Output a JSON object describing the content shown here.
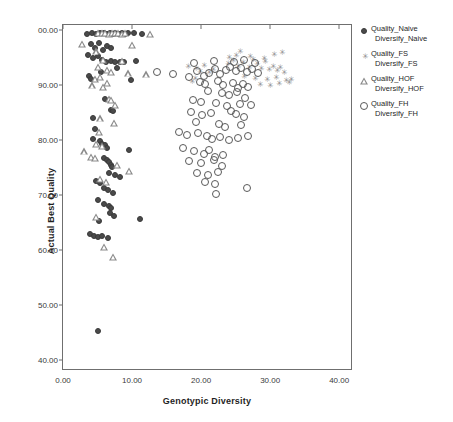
{
  "chart_data": {
    "type": "scatter",
    "title": "",
    "xlabel": "Genotypic Diversity",
    "ylabel": "Actual Best Quality",
    "xlim": [
      0,
      42
    ],
    "ylim": [
      38,
      101
    ],
    "xticks": [
      "0.00",
      "10.00",
      "20.00",
      "30.00",
      "40.00"
    ],
    "xtick_values": [
      0,
      10,
      20,
      30,
      40
    ],
    "yticks": [
      "00.00",
      "90.00",
      "80.00",
      "70.00",
      "60.00",
      "50.00",
      "40.00"
    ],
    "ytick_values": [
      100,
      90,
      80,
      70,
      60,
      50,
      40
    ],
    "grid": false,
    "legend_position": "right",
    "series": [
      {
        "name": "Quality_Naive",
        "name_line2": "Diversify_Naive",
        "marker": "filled-circle",
        "color": "#4a4a4a",
        "points": [
          [
            3.5,
            99.4
          ],
          [
            4.2,
            99.6
          ],
          [
            4.8,
            99.3
          ],
          [
            5.4,
            99.5
          ],
          [
            5.9,
            99.6
          ],
          [
            6.3,
            99.4
          ],
          [
            6.8,
            99.6
          ],
          [
            7.2,
            99.3
          ],
          [
            7.6,
            99.5
          ],
          [
            8.1,
            99.4
          ],
          [
            8.6,
            99.6
          ],
          [
            9.0,
            99.3
          ],
          [
            9.4,
            99.5
          ],
          [
            10.3,
            99.5
          ],
          [
            11.4,
            99.4
          ],
          [
            4.0,
            97.6
          ],
          [
            4.6,
            96.9
          ],
          [
            5.2,
            97.8
          ],
          [
            5.8,
            96.4
          ],
          [
            6.4,
            97.2
          ],
          [
            7.0,
            96.8
          ],
          [
            3.6,
            95.6
          ],
          [
            4.4,
            95.0
          ],
          [
            5.0,
            95.4
          ],
          [
            5.6,
            94.6
          ],
          [
            6.2,
            94.2
          ],
          [
            6.9,
            94.4
          ],
          [
            7.5,
            94.3
          ],
          [
            8.2,
            94.3
          ],
          [
            8.8,
            94.2
          ],
          [
            10.6,
            94.5
          ],
          [
            7.8,
            93.2
          ],
          [
            5.5,
            92.4
          ],
          [
            3.8,
            91.8
          ],
          [
            4.1,
            91.2
          ],
          [
            9.8,
            91.0
          ],
          [
            6.1,
            87.6
          ],
          [
            7.0,
            85.6
          ],
          [
            7.3,
            85.4
          ],
          [
            4.3,
            84.1
          ],
          [
            4.6,
            82.0
          ],
          [
            4.4,
            80.2
          ],
          [
            5.3,
            79.8
          ],
          [
            5.7,
            79.4
          ],
          [
            6.1,
            79.1
          ],
          [
            6.4,
            78.6
          ],
          [
            9.6,
            78.3
          ],
          [
            5.9,
            76.8
          ],
          [
            6.3,
            76.4
          ],
          [
            6.7,
            76.0
          ],
          [
            6.9,
            75.6
          ],
          [
            7.1,
            75.2
          ],
          [
            6.6,
            74.0
          ],
          [
            7.5,
            73.6
          ],
          [
            8.2,
            73.4
          ],
          [
            4.8,
            72.6
          ],
          [
            5.4,
            72.2
          ],
          [
            6.0,
            71.4
          ],
          [
            6.5,
            70.9
          ],
          [
            7.2,
            70.4
          ],
          [
            5.0,
            69.2
          ],
          [
            5.9,
            68.4
          ],
          [
            6.6,
            68.0
          ],
          [
            7.0,
            67.6
          ],
          [
            6.8,
            66.8
          ],
          [
            7.4,
            66.2
          ],
          [
            5.2,
            65.4
          ],
          [
            3.9,
            63.0
          ],
          [
            4.5,
            62.6
          ],
          [
            5.1,
            62.4
          ],
          [
            5.7,
            62.5
          ],
          [
            6.5,
            62.2
          ],
          [
            11.2,
            65.6
          ],
          [
            5.0,
            45.2
          ]
        ]
      },
      {
        "name": "Quality_FS",
        "name_line2": "Diversify_FS",
        "marker": "asterisk",
        "color": "#8c8c8c",
        "points": [
          [
            18.0,
            93.6
          ],
          [
            19.2,
            93.2
          ],
          [
            19.8,
            92.6
          ],
          [
            20.4,
            93.8
          ],
          [
            21.0,
            92.4
          ],
          [
            21.6,
            93.0
          ],
          [
            23.8,
            94.0
          ],
          [
            24.6,
            94.6
          ],
          [
            25.3,
            93.6
          ],
          [
            26.0,
            94.2
          ],
          [
            26.8,
            93.4
          ],
          [
            27.4,
            94.8
          ],
          [
            28.0,
            94.1
          ],
          [
            28.6,
            93.2
          ],
          [
            29.2,
            94.4
          ],
          [
            29.8,
            93.0
          ],
          [
            30.3,
            93.6
          ],
          [
            30.9,
            92.8
          ],
          [
            31.4,
            93.4
          ],
          [
            31.9,
            92.4
          ],
          [
            24.0,
            95.2
          ],
          [
            25.0,
            95.6
          ],
          [
            27.0,
            95.4
          ],
          [
            29.0,
            95.0
          ],
          [
            30.5,
            95.8
          ],
          [
            26.2,
            91.8
          ],
          [
            27.8,
            91.4
          ],
          [
            29.4,
            91.2
          ],
          [
            30.8,
            91.6
          ],
          [
            32.2,
            91.0
          ],
          [
            28.4,
            90.2
          ],
          [
            29.9,
            90.0
          ],
          [
            31.2,
            90.4
          ],
          [
            32.6,
            90.6
          ],
          [
            33.0,
            91.2
          ],
          [
            25.6,
            96.2
          ],
          [
            31.6,
            96.0
          ],
          [
            19.0,
            91.4
          ],
          [
            18.6,
            90.8
          ]
        ]
      },
      {
        "name": "Quality_HOF",
        "name_line2": "Diversify_HOF",
        "marker": "open-triangle",
        "color": "#8a8a8a",
        "points": [
          [
            5.0,
            99.6
          ],
          [
            5.6,
            99.5
          ],
          [
            6.1,
            99.6
          ],
          [
            6.6,
            99.4
          ],
          [
            7.1,
            99.6
          ],
          [
            7.6,
            99.5
          ],
          [
            8.0,
            99.6
          ],
          [
            8.5,
            99.4
          ],
          [
            9.0,
            99.5
          ],
          [
            12.6,
            99.4
          ],
          [
            2.8,
            97.6
          ],
          [
            10.0,
            97.4
          ],
          [
            4.8,
            96.2
          ],
          [
            5.8,
            94.6
          ],
          [
            8.5,
            94.4
          ],
          [
            5.0,
            93.4
          ],
          [
            6.4,
            92.8
          ],
          [
            7.0,
            92.4
          ],
          [
            9.4,
            92.2
          ],
          [
            12.0,
            92.0
          ],
          [
            4.6,
            91.2
          ],
          [
            5.4,
            91.6
          ],
          [
            6.4,
            90.4
          ],
          [
            4.2,
            90.0
          ],
          [
            5.8,
            89.8
          ],
          [
            6.6,
            87.6
          ],
          [
            7.0,
            87.4
          ],
          [
            7.6,
            86.4
          ],
          [
            5.4,
            84.0
          ],
          [
            7.4,
            83.2
          ],
          [
            5.2,
            81.6
          ],
          [
            4.8,
            79.4
          ],
          [
            5.6,
            79.0
          ],
          [
            3.0,
            78.0
          ],
          [
            4.0,
            77.0
          ],
          [
            4.6,
            76.8
          ],
          [
            7.8,
            75.6
          ],
          [
            9.6,
            74.4
          ],
          [
            5.4,
            73.0
          ],
          [
            6.2,
            72.4
          ],
          [
            4.8,
            66.0
          ],
          [
            6.0,
            60.6
          ],
          [
            7.2,
            58.8
          ]
        ]
      },
      {
        "name": "Quality_FH",
        "name_line2": "Diversify_FH",
        "marker": "open-circle",
        "color": "#595959",
        "points": [
          [
            13.6,
            92.4
          ],
          [
            16.0,
            92.0
          ],
          [
            18.2,
            91.6
          ],
          [
            19.4,
            92.6
          ],
          [
            20.4,
            91.8
          ],
          [
            21.2,
            92.2
          ],
          [
            22.0,
            93.0
          ],
          [
            22.8,
            92.0
          ],
          [
            23.6,
            92.8
          ],
          [
            24.2,
            93.4
          ],
          [
            25.0,
            92.6
          ],
          [
            25.8,
            93.2
          ],
          [
            26.6,
            92.4
          ],
          [
            27.4,
            93.0
          ],
          [
            28.2,
            92.2
          ],
          [
            19.0,
            94.0
          ],
          [
            21.8,
            94.4
          ],
          [
            24.8,
            94.2
          ],
          [
            26.2,
            94.6
          ],
          [
            27.8,
            94.0
          ],
          [
            19.8,
            90.6
          ],
          [
            20.6,
            90.2
          ],
          [
            22.4,
            90.8
          ],
          [
            23.2,
            90.0
          ],
          [
            24.6,
            90.4
          ],
          [
            25.4,
            89.6
          ],
          [
            26.0,
            90.2
          ],
          [
            26.8,
            89.8
          ],
          [
            21.0,
            89.0
          ],
          [
            23.0,
            88.6
          ],
          [
            24.0,
            88.2
          ],
          [
            25.2,
            88.8
          ],
          [
            26.4,
            87.8
          ],
          [
            22.2,
            86.8
          ],
          [
            23.8,
            86.2
          ],
          [
            25.6,
            86.6
          ],
          [
            18.6,
            85.2
          ],
          [
            20.2,
            84.6
          ],
          [
            21.4,
            85.0
          ],
          [
            24.4,
            85.4
          ],
          [
            25.0,
            84.8
          ],
          [
            26.2,
            84.2
          ],
          [
            19.2,
            83.4
          ],
          [
            22.6,
            83.0
          ],
          [
            23.4,
            82.4
          ],
          [
            25.8,
            82.8
          ],
          [
            16.8,
            81.6
          ],
          [
            18.0,
            81.0
          ],
          [
            19.6,
            81.4
          ],
          [
            20.8,
            80.8
          ],
          [
            21.6,
            80.2
          ],
          [
            22.8,
            80.6
          ],
          [
            24.0,
            80.0
          ],
          [
            25.4,
            80.4
          ],
          [
            26.8,
            80.8
          ],
          [
            17.4,
            78.6
          ],
          [
            19.0,
            78.0
          ],
          [
            20.4,
            77.6
          ],
          [
            21.2,
            78.2
          ],
          [
            22.0,
            77.0
          ],
          [
            23.2,
            77.4
          ],
          [
            18.2,
            76.2
          ],
          [
            20.0,
            75.8
          ],
          [
            21.8,
            76.4
          ],
          [
            23.0,
            75.4
          ],
          [
            19.4,
            74.0
          ],
          [
            21.0,
            73.6
          ],
          [
            22.4,
            74.2
          ],
          [
            20.6,
            72.4
          ],
          [
            22.0,
            72.0
          ],
          [
            26.6,
            71.4
          ],
          [
            22.2,
            70.2
          ],
          [
            18.8,
            87.4
          ],
          [
            20.0,
            87.0
          ],
          [
            27.2,
            86.4
          ]
        ]
      }
    ]
  },
  "legend": {
    "items": [
      {
        "label_line1": "Quality_Naive",
        "label_line2": "Diversify_Naive",
        "marker": "filled-circle"
      },
      {
        "label_line1": "Quality_FS",
        "label_line2": "Diversify_FS",
        "marker": "asterisk"
      },
      {
        "label_line1": "Quality_HOF",
        "label_line2": "Diversify_HOF",
        "marker": "open-triangle"
      },
      {
        "label_line1": "Quality_FH",
        "label_line2": "Diversify_FH",
        "marker": "open-circle"
      }
    ]
  }
}
